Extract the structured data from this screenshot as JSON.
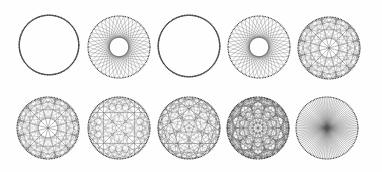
{
  "figure": {
    "rows": 2,
    "cols": 5,
    "background": "#fefefe",
    "line_color": "#555555",
    "dot_color": "#333333"
  },
  "patterns": [
    {
      "id": "p1",
      "cx": 49,
      "cy": 45,
      "r": 30,
      "n": 120,
      "mode": "step",
      "k": 7,
      "line_opacity": 0.55
    },
    {
      "id": "p2",
      "cx": 119,
      "cy": 47,
      "r": 31,
      "n": 40,
      "mode": "step",
      "k": 16,
      "line_opacity": 0.6
    },
    {
      "id": "p3",
      "cx": 189,
      "cy": 46,
      "r": 31,
      "n": 120,
      "mode": "step",
      "k": 7,
      "line_opacity": 0.55
    },
    {
      "id": "p4",
      "cx": 259,
      "cy": 47,
      "r": 31,
      "n": 40,
      "mode": "step",
      "k": 16,
      "line_opacity": 0.6
    },
    {
      "id": "p5",
      "cx": 329,
      "cy": 48,
      "r": 31,
      "n": 120,
      "mode": "mult",
      "k": 37,
      "line_opacity": 0.45
    },
    {
      "id": "p6",
      "cx": 48,
      "cy": 128,
      "r": 31,
      "n": 120,
      "mode": "mult",
      "k": 13,
      "line_opacity": 0.45
    },
    {
      "id": "p7",
      "cx": 119,
      "cy": 128,
      "r": 31,
      "n": 120,
      "mode": "mult",
      "k": 53,
      "line_opacity": 0.4
    },
    {
      "id": "p8",
      "cx": 189,
      "cy": 128,
      "r": 31,
      "n": 120,
      "mode": "mult",
      "k": 26,
      "line_opacity": 0.5
    },
    {
      "id": "p9",
      "cx": 258,
      "cy": 128,
      "r": 31,
      "n": 200,
      "mode": "mult",
      "k": 71,
      "line_opacity": 0.55
    },
    {
      "id": "p10",
      "cx": 327,
      "cy": 128,
      "r": 31,
      "n": 200,
      "mode": "mult",
      "k": 101,
      "line_opacity": 0.4
    }
  ]
}
